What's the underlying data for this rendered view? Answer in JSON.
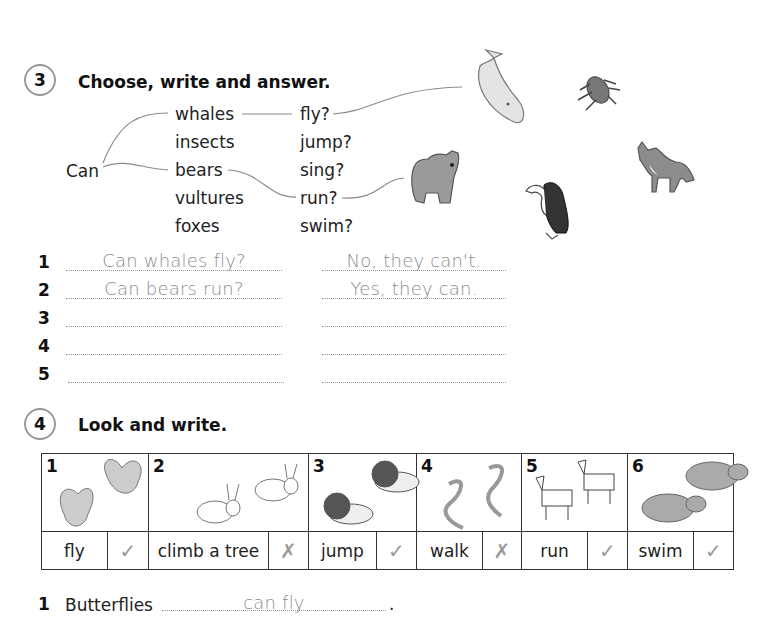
{
  "exercise3": {
    "number": "3",
    "title": "Choose, write and answer.",
    "starter": "Can",
    "subjects": [
      "whales",
      "insects",
      "bears",
      "vultures",
      "foxes"
    ],
    "verbs": [
      "fly?",
      "jump?",
      "sing?",
      "run?",
      "swim?"
    ],
    "pictures": [
      "whale-picture",
      "insect-picture",
      "bear-picture",
      "vulture-picture",
      "fox-picture"
    ],
    "rows": [
      {
        "num": "1",
        "question": "Can whales fly?",
        "answer": "No, they can't."
      },
      {
        "num": "2",
        "question": "Can bears run?",
        "answer": "Yes, they can."
      },
      {
        "num": "3",
        "question": "",
        "answer": ""
      },
      {
        "num": "4",
        "question": "",
        "answer": ""
      },
      {
        "num": "5",
        "question": "",
        "answer": ""
      }
    ]
  },
  "exercise4": {
    "number": "4",
    "title": "Look and write.",
    "cells": [
      {
        "num": "1",
        "animal": "butterflies",
        "verb": "fly",
        "mark": "✓",
        "mark_name": "tick"
      },
      {
        "num": "2",
        "animal": "rabbits",
        "verb": "climb a tree",
        "mark": "✗",
        "mark_name": "cross"
      },
      {
        "num": "3",
        "animal": "lions",
        "verb": "jump",
        "mark": "✓",
        "mark_name": "tick"
      },
      {
        "num": "4",
        "animal": "snakes",
        "verb": "walk",
        "mark": "✗",
        "mark_name": "cross"
      },
      {
        "num": "5",
        "animal": "zebras",
        "verb": "run",
        "mark": "✓",
        "mark_name": "tick"
      },
      {
        "num": "6",
        "animal": "hippos",
        "verb": "swim",
        "mark": "✓",
        "mark_name": "tick"
      }
    ],
    "sentences": [
      {
        "num": "1",
        "subject": "Butterflies",
        "answer": "can fly",
        "end": "."
      }
    ]
  }
}
